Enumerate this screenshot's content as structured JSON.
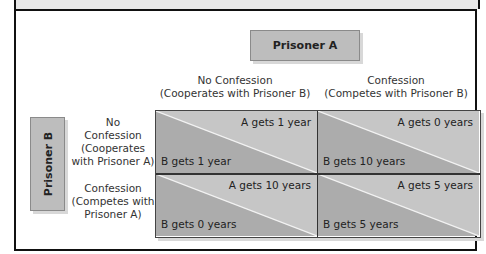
{
  "title_box": {
    "player_a": "Prisoner A",
    "player_b": "Prisoner B"
  },
  "columns": [
    {
      "line1": "No Confession",
      "line2": "(Cooperates with Prisoner B)"
    },
    {
      "line1": "Confession",
      "line2": "(Competes with Prisoner B)"
    }
  ],
  "rows": [
    {
      "line1": "No",
      "line2": "Confession",
      "line3": "(Cooperates",
      "line4": "with Prisoner A)"
    },
    {
      "line1": "Confession",
      "line2": "(Competes with",
      "line3": "Prisoner A)"
    }
  ],
  "cells": [
    {
      "a": "A gets 1 year",
      "b": "B gets 1 year"
    },
    {
      "a": "A gets 0 years",
      "b": "B gets 10 years"
    },
    {
      "a": "A gets 10 years",
      "b": "B gets 0 years"
    },
    {
      "a": "A gets 5 years",
      "b": "B gets 5 years"
    }
  ],
  "colors": {
    "upper_triangle": "#c6c6c6",
    "lower_triangle": "#acacac",
    "header_box": "#bdbdbd",
    "diagonal": "#f2f2f2"
  }
}
